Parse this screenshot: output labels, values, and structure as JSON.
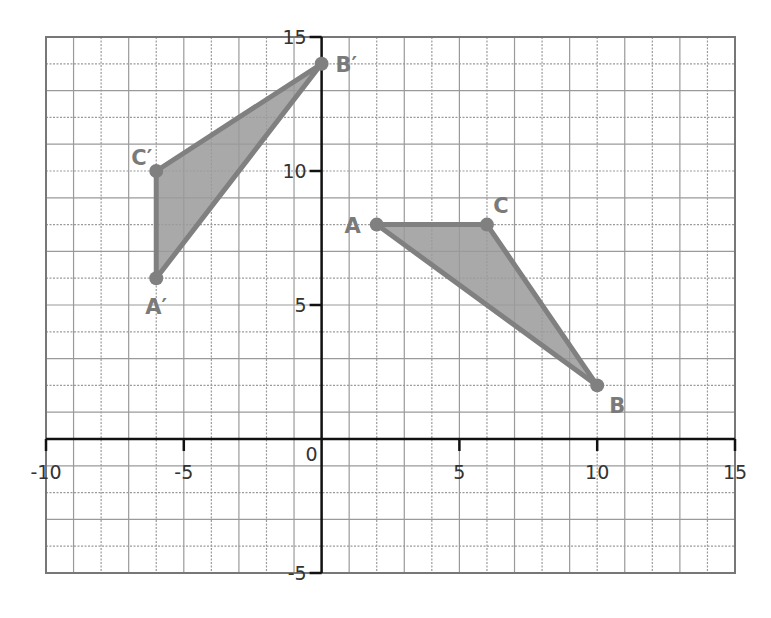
{
  "chart_data": {
    "type": "scatter",
    "title": "",
    "xlabel": "",
    "ylabel": "",
    "xlim": [
      -10,
      15
    ],
    "ylim": [
      -5,
      15
    ],
    "grid": true,
    "x_ticks": [
      -10,
      -5,
      0,
      5,
      10,
      15
    ],
    "y_ticks": [
      -5,
      5,
      10,
      15
    ],
    "x_tick_labels": [
      "-10",
      "-5",
      "0",
      "5",
      "10",
      "15"
    ],
    "y_tick_labels": [
      "-5",
      "5",
      "10",
      "15"
    ],
    "series": [
      {
        "name": "Triangle ABC",
        "shape": "polygon",
        "points": [
          {
            "label": "A",
            "x": 2,
            "y": 8
          },
          {
            "label": "C",
            "x": 6,
            "y": 8
          },
          {
            "label": "B",
            "x": 10,
            "y": 2
          }
        ]
      },
      {
        "name": "Triangle A'B'C'",
        "shape": "polygon",
        "points": [
          {
            "label": "A′",
            "x": -6,
            "y": 6
          },
          {
            "label": "C′",
            "x": -6,
            "y": 10
          },
          {
            "label": "B′",
            "x": 0,
            "y": 14
          }
        ]
      }
    ],
    "colors": {
      "fill": "#9a9a9a",
      "stroke": "#808080",
      "axis": "#111111",
      "grid": "#9a9a9a"
    }
  }
}
